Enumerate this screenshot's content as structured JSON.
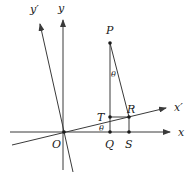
{
  "diagram": {
    "type": "coordinate-rotation",
    "points": {
      "O": {
        "label": "O"
      },
      "P": {
        "label": "P"
      },
      "T": {
        "label": "T"
      },
      "R": {
        "label": "R"
      },
      "Q": {
        "label": "Q"
      },
      "S": {
        "label": "S"
      }
    },
    "axes": {
      "x": {
        "label": "x"
      },
      "y": {
        "label": "y"
      },
      "x_prime": {
        "label": "x′"
      },
      "y_prime": {
        "label": "y′"
      }
    },
    "angles": {
      "theta_at_P": "θ",
      "theta_at_O": "θ"
    },
    "colors": {
      "line": "#3a3a3a",
      "text": "#1a1a1a",
      "background": "#ffffff"
    }
  }
}
